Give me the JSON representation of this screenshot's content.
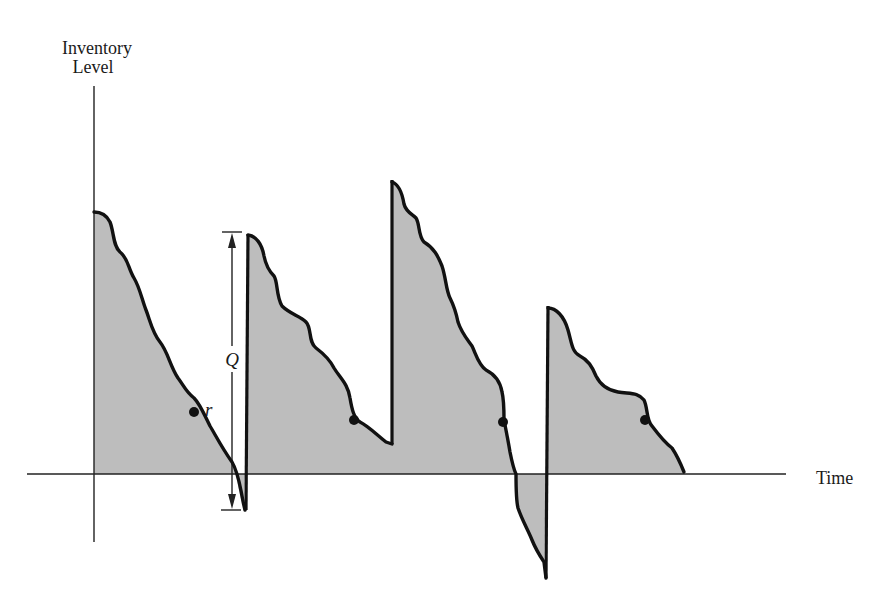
{
  "diagram": {
    "y_axis_label_line1": "Inventory",
    "y_axis_label_line2": "Level",
    "x_axis_label": "Time",
    "order_quantity_label": "Q",
    "reorder_point_label": "r",
    "colors": {
      "line": "#111111",
      "fill": "#bdbdbd",
      "background": "#ffffff"
    },
    "cycles": [
      {
        "name": "cycle-1",
        "start_level": "high",
        "ends_in_stockout": true,
        "reorder_marker": true
      },
      {
        "name": "cycle-2",
        "start_level": "high",
        "ends_in_stockout": false,
        "reorder_marker": true
      },
      {
        "name": "cycle-3",
        "start_level": "highest",
        "ends_in_stockout": true,
        "reorder_marker": true
      },
      {
        "name": "cycle-4",
        "start_level": "medium",
        "ends_in_stockout": false,
        "reorder_marker": true
      }
    ]
  }
}
